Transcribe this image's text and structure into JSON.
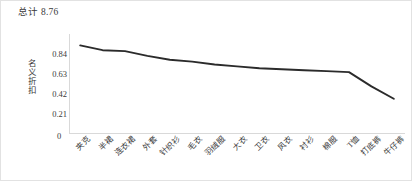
{
  "chart_data": {
    "type": "line",
    "title": "总计 8.76",
    "xlabel": "",
    "ylabel": "名义折扣",
    "categories": [
      "夹克",
      "半裙",
      "连衣裙",
      "外套",
      "针织衫",
      "毛衣",
      "羽绒服",
      "大衣",
      "卫衣",
      "风衣",
      "衬衫",
      "棉服",
      "T恤",
      "打底裤",
      "牛仔裤"
    ],
    "values": [
      0.93,
      0.88,
      0.87,
      0.82,
      0.78,
      0.76,
      0.73,
      0.71,
      0.69,
      0.68,
      0.67,
      0.66,
      0.65,
      0.5,
      0.37
    ],
    "yticks": [
      0.21,
      0.42,
      0.63,
      0.84
    ],
    "ytick_labels": [
      "0.21",
      "0.42",
      "0.63",
      "0.84"
    ],
    "y_zero_label": "0",
    "ylim": [
      0,
      1.05
    ],
    "grid": false,
    "legend": "none",
    "series_color": "#2b2b2b",
    "axis_color": "#d9d9d9",
    "text_color": "#3a3a3a"
  }
}
